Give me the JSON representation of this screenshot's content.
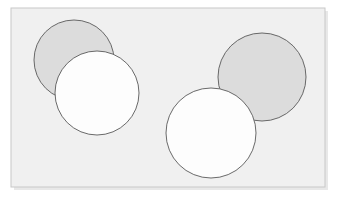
{
  "figure": {
    "canvas": {
      "width": 337,
      "height": 199
    },
    "background_color": "#ffffff",
    "frame": {
      "name": "rectangle-frame",
      "x": 11,
      "y": 8,
      "width": 314,
      "height": 179,
      "fill_color": "#f0f0f0",
      "stroke_color": "#c8c8c8",
      "stroke_width": 1,
      "shadow_color": "#d6d6d6"
    },
    "shapes": [
      {
        "id": "circle-1",
        "name": "gray-circle-upper-left",
        "label": "Gray circle (upper left)",
        "cx": 74,
        "cy": 60,
        "r": 40,
        "fill_color": "#dcdcdc",
        "stroke_color": "#595959",
        "stroke_width": 0.9,
        "fill_label": "gray"
      },
      {
        "id": "circle-2",
        "name": "white-circle-left",
        "label": "White circle (left)",
        "cx": 97,
        "cy": 93,
        "r": 42,
        "fill_color": "#fdfdfd",
        "stroke_color": "#595959",
        "stroke_width": 0.9,
        "fill_label": "white"
      },
      {
        "id": "circle-3",
        "name": "gray-circle-upper-right",
        "label": "Gray circle (upper right)",
        "cx": 262,
        "cy": 77,
        "r": 44,
        "fill_color": "#dcdcdc",
        "stroke_color": "#595959",
        "stroke_width": 0.9,
        "fill_label": "gray"
      },
      {
        "id": "circle-4",
        "name": "white-circle-right",
        "label": "White circle (right)",
        "cx": 211,
        "cy": 133,
        "r": 45,
        "fill_color": "#fdfdfd",
        "stroke_color": "#595959",
        "stroke_width": 0.9,
        "fill_label": "white"
      }
    ],
    "counts": {
      "total_circles": 4,
      "gray_circles": 2,
      "white_circles": 2,
      "overlapping_pairs": 2
    }
  }
}
